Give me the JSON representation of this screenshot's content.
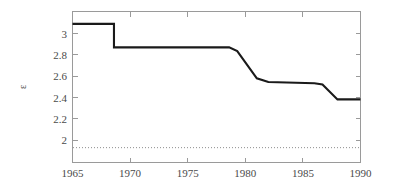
{
  "figure": {
    "width": 395,
    "height": 194,
    "background": "#ffffff",
    "line_color": "#1a1a1a",
    "axis_color": "#9a9a9a",
    "text_color": "#4a4a4a",
    "reference_line_color": "#8d8d8d"
  },
  "chart_data": {
    "type": "line",
    "title": "",
    "xlabel": "",
    "ylabel": "ε",
    "xlim": [
      1965,
      1990
    ],
    "ylim": [
      1.88,
      3.1
    ],
    "grid": false,
    "legend": null,
    "x_ticks": [
      1965,
      1970,
      1975,
      1980,
      1985,
      1990
    ],
    "x_tick_labels": [
      "1965",
      "1970",
      "1975",
      "1980",
      "1985",
      "1990"
    ],
    "y_ticks": [
      2,
      2.2,
      2.4,
      2.6,
      2.8,
      3
    ],
    "y_tick_labels": [
      "2",
      "2.2",
      "2.4",
      "2.6",
      "2.8",
      "3"
    ],
    "series": [
      {
        "name": "epsilon",
        "x": [
          1965.0,
          1968.6,
          1968.6,
          1978.6,
          1979.3,
          1981.0,
          1982.0,
          1986.0,
          1986.7,
          1988.0,
          1990.0
        ],
        "values": [
          3.0,
          3.0,
          2.81,
          2.81,
          2.78,
          2.56,
          2.53,
          2.52,
          2.51,
          2.39,
          2.39
        ]
      }
    ],
    "annotations": [
      {
        "kind": "horizontal-reference-line",
        "y": 2.0,
        "style": "dotted",
        "label": ""
      }
    ]
  }
}
